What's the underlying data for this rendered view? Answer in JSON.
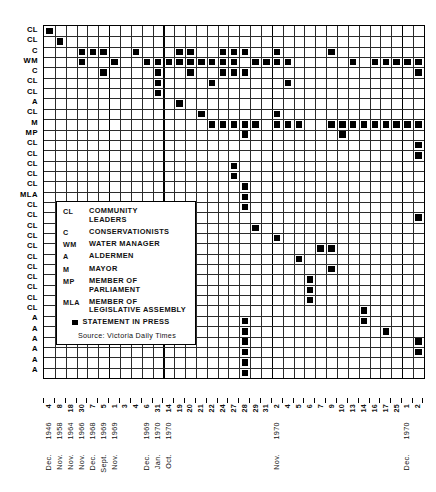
{
  "chart_data": {
    "type": "heatmap",
    "title": "",
    "xlabel": "",
    "ylabel": "",
    "grid": true,
    "legend_position": "inset-left",
    "marker_meaning": "STATEMENT IN PRESS",
    "source": "Source: Victoria Daily Times",
    "rows": [
      {
        "index": 0,
        "label": "CL"
      },
      {
        "index": 1,
        "label": "CL"
      },
      {
        "index": 2,
        "label": "C"
      },
      {
        "index": 3,
        "label": "WM"
      },
      {
        "index": 4,
        "label": "C"
      },
      {
        "index": 5,
        "label": "CL"
      },
      {
        "index": 6,
        "label": "CL"
      },
      {
        "index": 7,
        "label": "A"
      },
      {
        "index": 8,
        "label": "CL"
      },
      {
        "index": 9,
        "label": "M"
      },
      {
        "index": 10,
        "label": "MP"
      },
      {
        "index": 11,
        "label": "CL"
      },
      {
        "index": 12,
        "label": "CL"
      },
      {
        "index": 13,
        "label": "CL"
      },
      {
        "index": 14,
        "label": "CL"
      },
      {
        "index": 15,
        "label": "CL"
      },
      {
        "index": 16,
        "label": "MLA"
      },
      {
        "index": 17,
        "label": "CL"
      },
      {
        "index": 18,
        "label": "CL"
      },
      {
        "index": 19,
        "label": "CL"
      },
      {
        "index": 20,
        "label": "CL"
      },
      {
        "index": 21,
        "label": "CL"
      },
      {
        "index": 22,
        "label": "CL"
      },
      {
        "index": 23,
        "label": "CL"
      },
      {
        "index": 24,
        "label": "CL"
      },
      {
        "index": 25,
        "label": "CL"
      },
      {
        "index": 26,
        "label": "CL"
      },
      {
        "index": 27,
        "label": "CL"
      },
      {
        "index": 28,
        "label": "A"
      },
      {
        "index": 29,
        "label": "A"
      },
      {
        "index": 30,
        "label": "A"
      },
      {
        "index": 31,
        "label": "A"
      },
      {
        "index": 32,
        "label": "A"
      },
      {
        "index": 33,
        "label": "A"
      }
    ],
    "columns": [
      {
        "index": 0,
        "day": "4",
        "month": "Dec.",
        "year": "1946"
      },
      {
        "index": 1,
        "day": "8",
        "month": "Nov.",
        "year": "1958"
      },
      {
        "index": 2,
        "day": "18",
        "month": "Nov.",
        "year": "1964"
      },
      {
        "index": 3,
        "day": "30",
        "month": "Nov.",
        "year": "1966"
      },
      {
        "index": 4,
        "day": "7",
        "month": "Dec.",
        "year": "1968"
      },
      {
        "index": 5,
        "day": "5",
        "month": "Sept.",
        "year": "1969"
      },
      {
        "index": 6,
        "day": "1",
        "month": "Nov.",
        "year": "1969"
      },
      {
        "index": 7,
        "day": "3",
        "month": "",
        "year": ""
      },
      {
        "index": 8,
        "day": "4",
        "month": "",
        "year": ""
      },
      {
        "index": 9,
        "day": "6",
        "month": "Dec.",
        "year": "1969"
      },
      {
        "index": 10,
        "day": "31",
        "month": "Jan.",
        "year": "1970"
      },
      {
        "index": 11,
        "day": "14",
        "month": "Oct.",
        "year": "1970"
      },
      {
        "index": 12,
        "day": "19",
        "month": "",
        "year": ""
      },
      {
        "index": 13,
        "day": "20",
        "month": "",
        "year": ""
      },
      {
        "index": 14,
        "day": "21",
        "month": "",
        "year": ""
      },
      {
        "index": 15,
        "day": "22",
        "month": "",
        "year": ""
      },
      {
        "index": 16,
        "day": "24",
        "month": "",
        "year": ""
      },
      {
        "index": 17,
        "day": "27",
        "month": "",
        "year": ""
      },
      {
        "index": 18,
        "day": "28",
        "month": "",
        "year": ""
      },
      {
        "index": 19,
        "day": "29",
        "month": "",
        "year": ""
      },
      {
        "index": 20,
        "day": "31",
        "month": "",
        "year": ""
      },
      {
        "index": 21,
        "day": "2",
        "month": "Nov.",
        "year": "1970"
      },
      {
        "index": 22,
        "day": "4",
        "month": "",
        "year": ""
      },
      {
        "index": 23,
        "day": "5",
        "month": "",
        "year": ""
      },
      {
        "index": 24,
        "day": "6",
        "month": "",
        "year": ""
      },
      {
        "index": 25,
        "day": "7",
        "month": "",
        "year": ""
      },
      {
        "index": 26,
        "day": "9",
        "month": "",
        "year": ""
      },
      {
        "index": 27,
        "day": "10",
        "month": "",
        "year": ""
      },
      {
        "index": 28,
        "day": "13",
        "month": "",
        "year": ""
      },
      {
        "index": 29,
        "day": "14",
        "month": "",
        "year": ""
      },
      {
        "index": 30,
        "day": "16",
        "month": "",
        "year": ""
      },
      {
        "index": 31,
        "day": "17",
        "month": "",
        "year": ""
      },
      {
        "index": 32,
        "day": "25",
        "month": "",
        "year": ""
      },
      {
        "index": 33,
        "day": "1",
        "month": "Dec.",
        "year": "1970"
      },
      {
        "index": 34,
        "day": "2",
        "month": "",
        "year": ""
      }
    ],
    "marks": [
      {
        "row": 0,
        "cols": [
          0
        ]
      },
      {
        "row": 1,
        "cols": [
          1
        ]
      },
      {
        "row": 2,
        "cols": [
          3,
          4,
          5,
          8,
          12,
          13,
          16,
          17,
          18,
          21,
          26
        ]
      },
      {
        "row": 3,
        "cols": [
          3,
          6,
          9,
          10,
          11,
          12,
          13,
          14,
          15,
          16,
          17,
          19,
          20,
          21,
          22,
          28,
          30,
          31,
          32,
          33,
          34
        ]
      },
      {
        "row": 4,
        "cols": [
          5,
          10,
          13,
          16,
          17,
          18,
          34
        ]
      },
      {
        "row": 5,
        "cols": [
          10,
          15,
          22
        ]
      },
      {
        "row": 6,
        "cols": [
          10
        ]
      },
      {
        "row": 7,
        "cols": [
          12
        ]
      },
      {
        "row": 8,
        "cols": [
          14,
          21
        ]
      },
      {
        "row": 9,
        "cols": [
          15,
          16,
          17,
          18,
          19,
          21,
          22,
          23,
          26,
          27,
          28,
          29,
          30,
          31,
          32,
          33,
          34
        ]
      },
      {
        "row": 10,
        "cols": [
          18,
          27
        ]
      },
      {
        "row": 11,
        "cols": [
          34
        ]
      },
      {
        "row": 12,
        "cols": [
          34
        ]
      },
      {
        "row": 13,
        "cols": [
          17
        ]
      },
      {
        "row": 14,
        "cols": [
          17
        ]
      },
      {
        "row": 15,
        "cols": [
          18
        ]
      },
      {
        "row": 16,
        "cols": [
          18
        ]
      },
      {
        "row": 17,
        "cols": [
          18
        ]
      },
      {
        "row": 18,
        "cols": [
          34
        ]
      },
      {
        "row": 19,
        "cols": [
          19
        ]
      },
      {
        "row": 20,
        "cols": [
          21
        ]
      },
      {
        "row": 21,
        "cols": [
          25,
          26
        ]
      },
      {
        "row": 22,
        "cols": [
          23
        ]
      },
      {
        "row": 23,
        "cols": [
          26
        ]
      },
      {
        "row": 24,
        "cols": [
          24
        ]
      },
      {
        "row": 25,
        "cols": [
          24
        ]
      },
      {
        "row": 26,
        "cols": [
          24
        ]
      },
      {
        "row": 27,
        "cols": [
          29
        ]
      },
      {
        "row": 28,
        "cols": [
          29
        ]
      },
      {
        "row": 29,
        "cols": [
          31
        ]
      },
      {
        "row": 30,
        "cols": [
          34
        ]
      },
      {
        "row": 31,
        "cols": [
          34
        ]
      },
      {
        "row": 32,
        "cols": [
          18
        ]
      },
      {
        "row": 33,
        "cols": [
          18
        ]
      }
    ],
    "bottom_extra_marks": [
      {
        "row": 28,
        "col": 18
      },
      {
        "row": 29,
        "col": 18
      },
      {
        "row": 30,
        "col": 18
      },
      {
        "row": 31,
        "col": 18
      },
      {
        "row": 32,
        "col": 18
      }
    ]
  },
  "legend": {
    "entries": [
      {
        "key": "CL",
        "line1": "COMMUNITY",
        "line2": "LEADERS"
      },
      {
        "key": "C",
        "line1": "CONSERVATIONISTS",
        "line2": ""
      },
      {
        "key": "WM",
        "line1": "WATER MANAGER",
        "line2": ""
      },
      {
        "key": "A",
        "line1": "ALDERMEN",
        "line2": ""
      },
      {
        "key": "M",
        "line1": "MAYOR",
        "line2": ""
      },
      {
        "key": "MP",
        "line1": "MEMBER OF",
        "line2": "PARLIAMENT"
      },
      {
        "key": "MLA",
        "line1": "MEMBER OF",
        "line2": "LEGISLATIVE ASSEMBLY"
      }
    ],
    "press_label": "STATEMENT IN PRESS",
    "source": "Source: Victoria Daily Times"
  }
}
